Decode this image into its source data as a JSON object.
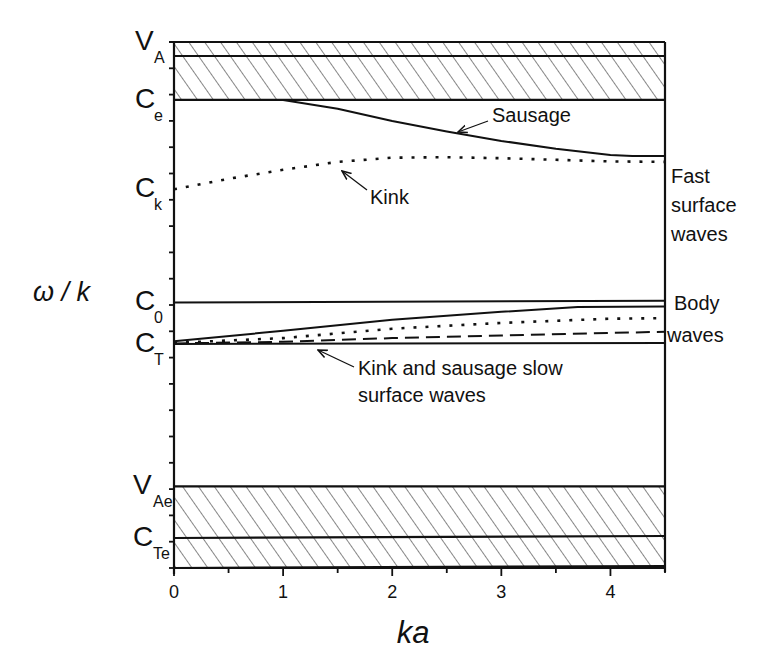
{
  "chart_data": {
    "type": "line",
    "title": "",
    "xlabel": "ka",
    "ylabel": "ω / k",
    "xlim": [
      0,
      4.5
    ],
    "ylim": [
      0,
      1
    ],
    "x_ticks": [
      "0",
      "1",
      "2",
      "3",
      "4"
    ],
    "x_tick_values": [
      0,
      1,
      2,
      3,
      4
    ],
    "y_axis_speed_labels": [
      {
        "main": "V",
        "sub": "A",
        "value": 1.0
      },
      {
        "main": "C",
        "sub": "e",
        "value": 0.89
      },
      {
        "main": "C",
        "sub": "k",
        "value": 0.72
      },
      {
        "main": "C",
        "sub": "0",
        "value": 0.505
      },
      {
        "main": "C",
        "sub": "T",
        "value": 0.425
      },
      {
        "main": "V",
        "sub": "Ae",
        "value": 0.155
      },
      {
        "main": "C",
        "sub": "Te",
        "value": 0.057
      }
    ],
    "hatched_bands": [
      {
        "name": "upper-band",
        "from": 0.89,
        "to": 1.0
      },
      {
        "name": "lower-band",
        "from": 0.0,
        "to": 0.155
      }
    ],
    "series": [
      {
        "name": "Sausage (fast surface)",
        "style": "solid",
        "x": [
          0,
          1.0,
          1.5,
          2.0,
          2.5,
          3.0,
          3.5,
          4.0,
          4.2,
          4.5
        ],
        "y": [
          0.89,
          0.89,
          0.873,
          0.85,
          0.83,
          0.812,
          0.797,
          0.785,
          0.783,
          0.783
        ]
      },
      {
        "name": "Kink (fast surface)",
        "style": "dotted",
        "x": [
          0,
          0.5,
          1.0,
          1.5,
          2.0,
          2.5,
          3.0,
          3.5,
          4.0,
          4.5
        ],
        "y": [
          0.72,
          0.74,
          0.757,
          0.772,
          0.78,
          0.781,
          0.779,
          0.776,
          0.773,
          0.772
        ]
      },
      {
        "name": "C0 line",
        "style": "solid",
        "x": [
          0,
          4.5
        ],
        "y": [
          0.505,
          0.508
        ]
      },
      {
        "name": "Body wave (solid)",
        "style": "solid",
        "x": [
          0,
          1.0,
          2.0,
          3.0,
          3.7,
          4.5
        ],
        "y": [
          0.431,
          0.451,
          0.472,
          0.487,
          0.496,
          0.497
        ]
      },
      {
        "name": "Body wave (dotted)",
        "style": "dotted",
        "x": [
          0,
          1.0,
          2.0,
          3.0,
          4.0,
          4.5
        ],
        "y": [
          0.428,
          0.437,
          0.455,
          0.466,
          0.474,
          0.475
        ]
      },
      {
        "name": "Body wave (dashed)",
        "style": "dashed",
        "x": [
          0,
          1.0,
          2.0,
          3.0,
          4.0,
          4.5
        ],
        "y": [
          0.427,
          0.43,
          0.437,
          0.442,
          0.447,
          0.449
        ]
      },
      {
        "name": "CT line",
        "style": "solid",
        "x": [
          0,
          4.5
        ],
        "y": [
          0.426,
          0.428
        ]
      }
    ],
    "annotations": [
      {
        "text": "Sausage",
        "target_series": "Sausage (fast surface)"
      },
      {
        "text": "Kink",
        "target_series": "Kink (fast surface)"
      },
      {
        "text": "Kink and sausage slow",
        "line2": "surface waves",
        "target_series": "CT line"
      },
      {
        "text": "Fast",
        "line2": "surface",
        "line3": "waves",
        "position": "right"
      },
      {
        "text": "Body",
        "line2": "waves",
        "position": "right"
      }
    ],
    "grid": false,
    "legend": "none"
  }
}
